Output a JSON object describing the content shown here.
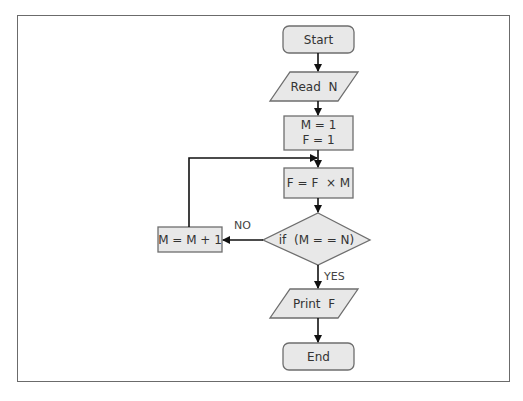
{
  "diagram": {
    "type": "flowchart",
    "nodes": [
      {
        "id": "start",
        "shape": "terminator",
        "label": "Start"
      },
      {
        "id": "read",
        "shape": "input-output",
        "label": "Read  N"
      },
      {
        "id": "init",
        "shape": "process",
        "line1": "M = 1",
        "line2": "F = 1"
      },
      {
        "id": "mult",
        "shape": "process",
        "label": "F = F  × M"
      },
      {
        "id": "cond",
        "shape": "decision",
        "label": "if  (M = = N)"
      },
      {
        "id": "inc",
        "shape": "process",
        "label": "M = M + 1"
      },
      {
        "id": "print",
        "shape": "input-output",
        "label": "Print  F"
      },
      {
        "id": "end",
        "shape": "terminator",
        "label": "End"
      }
    ],
    "edges": [
      {
        "from": "start",
        "to": "read"
      },
      {
        "from": "read",
        "to": "init"
      },
      {
        "from": "init",
        "to": "mult"
      },
      {
        "from": "mult",
        "to": "cond"
      },
      {
        "from": "cond",
        "to": "inc",
        "label": "NO"
      },
      {
        "from": "inc",
        "to": "mult"
      },
      {
        "from": "cond",
        "to": "print",
        "label": "YES"
      },
      {
        "from": "print",
        "to": "end"
      }
    ],
    "colors": {
      "fill": "#e8e8e8",
      "stroke": "#6e6e6e",
      "arrow": "#111111",
      "text": "#333333"
    }
  }
}
